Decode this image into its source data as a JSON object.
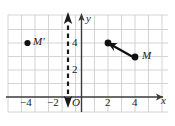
{
  "figure": {
    "type": "coordinate-plane-reflection-diagram",
    "axes": {
      "x_axis_label": "x",
      "y_axis_label": "y",
      "origin_label": "O",
      "x_ticks": [
        {
          "value": -4,
          "label": "−4"
        },
        {
          "value": -2,
          "label": "−2"
        },
        {
          "value": 2,
          "label": "2"
        },
        {
          "value": 4,
          "label": "4"
        }
      ],
      "y_ticks": [
        {
          "value": 2,
          "label": "2"
        },
        {
          "value": 4,
          "label": "4"
        }
      ],
      "x_range": [
        -5.4,
        6.4
      ],
      "y_range": [
        -1.1,
        6.1
      ],
      "grid": true,
      "grid_color": "#c9c9c9",
      "axis_color": "#3a3a3a"
    },
    "points": [
      {
        "name": "M-prime",
        "label": "M'",
        "x": -4,
        "y": 4,
        "label_side": "right"
      },
      {
        "name": "M-image-endpoint",
        "label": "",
        "x": 2,
        "y": 4,
        "label_side": "none"
      },
      {
        "name": "M",
        "label": "M",
        "x": 4,
        "y": 3,
        "label_side": "right"
      }
    ],
    "arrow": {
      "name": "translation-arrow",
      "from_x": 4,
      "from_y": 3,
      "to_x": 2,
      "to_y": 4,
      "color": "#111111"
    },
    "dashed_line": {
      "name": "reflection-line",
      "x": -1,
      "style": "dashed",
      "double_arrow": true,
      "color": "#1a1a1a"
    }
  }
}
